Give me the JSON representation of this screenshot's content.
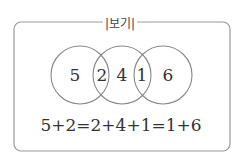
{
  "title": "|보기|",
  "venn": {
    "regions": [
      {
        "id": "left-only",
        "value": "5"
      },
      {
        "id": "left-middle",
        "value": "2"
      },
      {
        "id": "middle-only",
        "value": "4"
      },
      {
        "id": "middle-right",
        "value": "1"
      },
      {
        "id": "right-only",
        "value": "6"
      }
    ]
  },
  "equation": "5+2=2+4+1=1+6"
}
